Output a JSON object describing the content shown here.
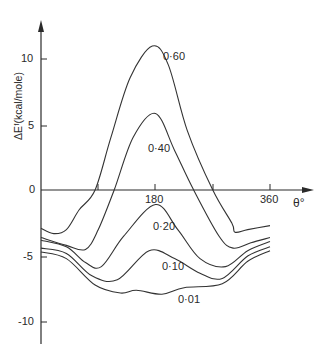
{
  "chart_data": {
    "type": "line",
    "title": "",
    "xlabel": "θ°",
    "ylabel": "ΔE^F (kcal/mole)",
    "xlim": [
      0,
      360
    ],
    "ylim": [
      -10.5,
      12
    ],
    "x_ticks": [
      90,
      180,
      270,
      360
    ],
    "x_tick_labels": [
      "",
      "180",
      "",
      "360"
    ],
    "y_ticks": [
      10,
      5,
      0,
      -5,
      -10
    ],
    "y_tick_labels": [
      "10",
      "5",
      "0",
      "-5",
      "-10"
    ],
    "grid": false,
    "legend": "inline curve labels",
    "series": [
      {
        "name": "0·60",
        "x": [
          0,
          20,
          40,
          60,
          85,
          110,
          140,
          175,
          200,
          230,
          270,
          300,
          305,
          325,
          360
        ],
        "values": [
          -2.9,
          -3.3,
          -3.0,
          -1.5,
          0,
          4,
          8.5,
          10.9,
          9.5,
          4.5,
          0,
          -2.5,
          -3.2,
          -3.0,
          -2.7
        ]
      },
      {
        "name": "0·40",
        "x": [
          0,
          40,
          70,
          90,
          115,
          145,
          180,
          210,
          240,
          280,
          302,
          330,
          360
        ],
        "values": [
          -3.6,
          -4.2,
          -4.5,
          -3.0,
          0,
          4,
          5.8,
          3,
          0,
          -3.5,
          -4.4,
          -4.0,
          -3.6
        ]
      },
      {
        "name": "0·20",
        "x": [
          0,
          40,
          70,
          95,
          130,
          180,
          215,
          250,
          290,
          325,
          360
        ],
        "values": [
          -3.8,
          -4.3,
          -5.5,
          -5.8,
          -3.5,
          -1.1,
          -3,
          -5.2,
          -5.8,
          -4.6,
          -3.9
        ]
      },
      {
        "name": "0·10",
        "x": [
          0,
          40,
          80,
          120,
          170,
          210,
          250,
          285,
          325,
          360
        ],
        "values": [
          -4.4,
          -4.8,
          -6.5,
          -6.8,
          -4.6,
          -5.2,
          -6.3,
          -6.7,
          -5.0,
          -4.3
        ]
      },
      {
        "name": "0·01",
        "x": [
          0,
          40,
          85,
          125,
          150,
          190,
          225,
          285,
          325,
          360
        ],
        "values": [
          -4.7,
          -5.2,
          -7.2,
          -7.8,
          -7.6,
          -7.9,
          -7.4,
          -7.1,
          -5.4,
          -4.6
        ]
      }
    ]
  },
  "labels": {
    "y_axis": "ΔEᶠ(kcal/mole)",
    "x_axis": "θ°",
    "y10": "10",
    "y5": "5",
    "y0": "0",
    "ym5": "-5",
    "ym10": "-10",
    "x180": "180",
    "x360": "360",
    "s060": "0·60",
    "s040": "0·40",
    "s020": "0·20",
    "s010": "0·10",
    "s001": "0·01"
  }
}
